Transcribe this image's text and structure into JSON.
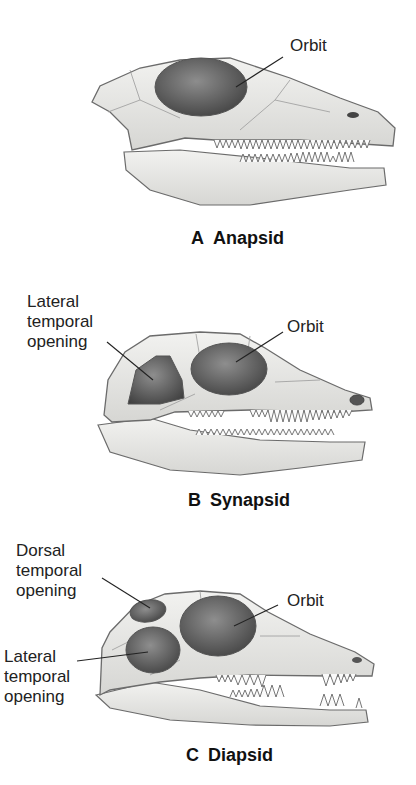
{
  "figure": {
    "panels": [
      {
        "id": "A",
        "letter": "A",
        "name": "Anapsid",
        "labels": {
          "orbit": "Orbit"
        }
      },
      {
        "id": "B",
        "letter": "B",
        "name": "Synapsid",
        "labels": {
          "orbit": "Orbit",
          "lateral_line1": "Lateral",
          "lateral_line2": "temporal",
          "lateral_line3": "opening"
        }
      },
      {
        "id": "C",
        "letter": "C",
        "name": "Diapsid",
        "labels": {
          "orbit": "Orbit",
          "dorsal_line1": "Dorsal",
          "dorsal_line2": "temporal",
          "dorsal_line3": "opening",
          "lateral_line1": "Lateral",
          "lateral_line2": "temporal",
          "lateral_line3": "opening"
        }
      }
    ],
    "colors": {
      "bone": "#ececea",
      "bone_shadow": "#c9c9c6",
      "outline": "#6b6b6b",
      "opening_dark": "#4a4a4a",
      "opening_light": "#9a9a9a"
    }
  }
}
